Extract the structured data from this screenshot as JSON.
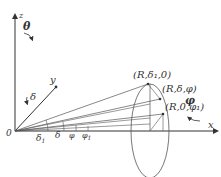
{
  "axes": {
    "z": "z",
    "y": "y",
    "x": "x",
    "origin": "0"
  },
  "angles": {
    "theta": "θ",
    "phi": "φ",
    "delta": "δ",
    "delta1": "δ",
    "delta1_sub": "1",
    "delta_b": "δ",
    "phi_b": "φ",
    "phi1": "φ",
    "phi1_sub": "1"
  },
  "points": {
    "p1": "(R,δ₁,0)",
    "p2": "(R,δ,φ)",
    "p3": "(R,0,φ₁)"
  }
}
